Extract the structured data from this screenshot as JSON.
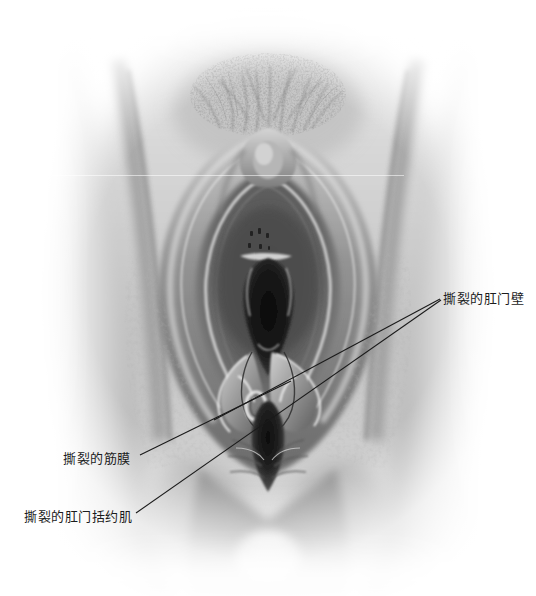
{
  "figure": {
    "kind": "anatomical-illustration",
    "style": "grayscale-airbrush",
    "background_color": "#ffffff",
    "width": 536,
    "height": 596,
    "ink_color": "#1a1a1a",
    "label_text_color": "#1c1c1c"
  },
  "annotations": [
    {
      "id": "anal-wall",
      "label": "撕裂的肛门壁",
      "text_x": 443,
      "text_y": 291,
      "leader": {
        "x1": 440,
        "y1": 299,
        "x2": 214,
        "y2": 420
      }
    },
    {
      "id": "fascia",
      "label": "撕裂的筋膜",
      "text_x": 63,
      "text_y": 451,
      "leader": {
        "x1": 140,
        "y1": 455,
        "x2": 291,
        "y2": 381
      }
    },
    {
      "id": "sphincter",
      "label": "撕裂的肛门括约肌",
      "text_x": 24,
      "text_y": 509,
      "leader": {
        "x1": 136,
        "y1": 513,
        "x2": 441,
        "y2": 300
      }
    }
  ]
}
